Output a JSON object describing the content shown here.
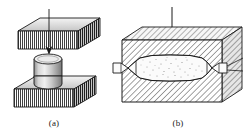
{
  "figure": {
    "title_visible": false,
    "background_color": "#ffffff",
    "ink_color": "#1a1a1a",
    "panels": [
      {
        "id": "a",
        "caption": "(a)",
        "caption_x": 54,
        "caption_y": 124,
        "description_parts": [
          "upper-die-block",
          "downward-force-arrow",
          "cylindrical-workpiece",
          "lower-die-block"
        ],
        "shading": "vertical-line-hatch",
        "arrow_direction": "down"
      },
      {
        "id": "b",
        "caption": "(b)",
        "caption_x": 178,
        "caption_y": 124,
        "description_parts": [
          "sectioned-die-block",
          "downward-force-arrow",
          "barrel-shaped-cavity",
          "flash-extrusion-left",
          "flash-extrusion-right",
          "molten-speckle-zone"
        ],
        "shading": "diagonal-section-hatch",
        "arrow_direction": "down"
      }
    ]
  },
  "colors": {
    "stroke": "#1a1a1a",
    "fill_light": "#f2f2f2",
    "fill_mid": "#d8d8d8",
    "fill_dark": "#9a9a9a",
    "hatch": "#2b2b2b",
    "speckle": "#3a3a3a",
    "paper": "#ffffff"
  },
  "geometry": {
    "panel_a": {
      "upper_block": {
        "front_x": 18,
        "front_y": 30,
        "w": 60,
        "h": 18,
        "depth_x": 22,
        "depth_y": -13
      },
      "lower_block": {
        "front_x": 14,
        "front_y": 88,
        "w": 60,
        "h": 18,
        "depth_x": 22,
        "depth_y": -13
      },
      "cylinder": {
        "cx": 48,
        "cy": 58,
        "rx": 14,
        "ry": 5,
        "height": 30
      },
      "arrow": {
        "x": 49,
        "y1": 10,
        "y2": 55
      }
    },
    "panel_b": {
      "block": {
        "front_x": 122,
        "front_y": 36,
        "w": 100,
        "h": 62,
        "depth_x": 20,
        "depth_y": -14
      },
      "arrow": {
        "x": 172,
        "y1": 8,
        "y2": 42
      },
      "cavity": {
        "cx": 170,
        "cy": 68,
        "w": 86,
        "h": 26
      }
    }
  }
}
